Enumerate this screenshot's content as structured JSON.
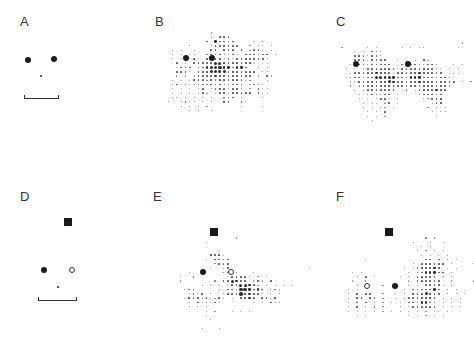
{
  "figure": {
    "panels": [
      {
        "id": "A",
        "label": "A",
        "label_pos": [
          20,
          14
        ],
        "marks": [
          {
            "type": "filled",
            "x": 28,
            "y": 60,
            "r": 3.2
          },
          {
            "type": "filled",
            "x": 54,
            "y": 59,
            "r": 3.2
          },
          {
            "type": "nose",
            "x": 41,
            "y": 76,
            "r": 1.2
          }
        ],
        "bracket": {
          "x1": 24,
          "x2": 59,
          "y": 95
        }
      },
      {
        "id": "B",
        "label": "B",
        "label_pos": [
          155,
          14
        ],
        "marks": [
          {
            "type": "filled",
            "x": 186,
            "y": 58,
            "r": 3.2
          },
          {
            "type": "filled",
            "x": 212,
            "y": 58,
            "r": 3.2
          }
        ],
        "grid": {
          "x0": 164,
          "y0": 33,
          "dx": 4.3,
          "dy": 4.3,
          "rows": [
            "...........1.................",
            "...........1.222.............",
            "..........2.32222....1.1.....",
            "......1....1222222..1.11.1...",
            "..1.1..1...22.222.2.1221.1...",
            "..1.1.11..12221221.222222.1..",
            "..1.1.121.222212122222221....",
            "...2.1.222224432232221.11....",
            "...1222.223545332332..1.1....",
            "...2221.22344442322222.11....",
            "...1.1.12222332222222.1.21...",
            "..1.1.122212222222211...1....",
            "..12121122122211222.1221.....",
            "..1.1.1.12.12221221.1.211....",
            "..1.1.1.121.122122222.211....",
            "..11.1.1.1.1..222.1....1.....",
            ".1..1211.1.1..22..21.........",
            "....1.1.1.1.......1....1.....",
            "......1.1..1.................."
          ]
        }
      },
      {
        "id": "C",
        "label": "C",
        "label_pos": [
          336,
          14
        ],
        "marks": [
          {
            "type": "filled",
            "x": 356,
            "y": 64,
            "r": 3.2
          },
          {
            "type": "filled",
            "x": 408,
            "y": 64,
            "r": 3.2
          }
        ],
        "grid": {
          "x0": 342,
          "y0": 43,
          "dx": 4.3,
          "dy": 4.3,
          "rows": [
            "............................1.",
            "1.....1.1.....1.1.11.......1..",
            "...1.1.221...................",
            "...2221221...................",
            "...22212222..1.1.1.21..........",
            "..1.22122222..212221221...1.1.",
            ".1.1.1222222212222222211.1.1..",
            "..1222223332122223332222.111...",
            ".1222222443432223332222221.....",
            "..1122222334322222333222222.1.1",
            "..1.1222222322222222222221.....",
            "...1.12222222.12.12222322......",
            "....1.122122.1....122222.......",
            "....1.1.1221.1.....11223.......",
            ".....1.11.12.1.......122.......",
            ".....1.1.11.1.......1.1.1......",
            "......1.1.2..........1.11......",
            "......1.1.1...........1........",
            ".......1......................."
          ]
        }
      },
      {
        "id": "D",
        "label": "D",
        "label_pos": [
          20,
          189
        ],
        "marks": [
          {
            "type": "square",
            "x": 68,
            "y": 222,
            "r": 4
          },
          {
            "type": "filled",
            "x": 44,
            "y": 270,
            "r": 3
          },
          {
            "type": "open",
            "x": 72,
            "y": 270,
            "r": 3
          },
          {
            "type": "nose",
            "x": 58,
            "y": 287,
            "r": 1.2
          }
        ],
        "bracket": {
          "x1": 38,
          "x2": 77,
          "y": 297
        }
      },
      {
        "id": "E",
        "label": "E",
        "label_pos": [
          153,
          189
        ],
        "marks": [
          {
            "type": "square",
            "x": 214,
            "y": 232,
            "r": 4
          },
          {
            "type": "filled",
            "x": 203,
            "y": 272,
            "r": 3.2
          },
          {
            "type": "open",
            "x": 231,
            "y": 272,
            "r": 3.2
          }
        ],
        "grid": {
          "x0": 172,
          "y0": 238,
          "dx": 4.3,
          "dy": 4.3,
          "rows": [
            "...............1..............",
            "........1......................",
            "...............................",
            "...........1..................",
            ".........2221..................",
            "........1.2222.................",
            "..........1222.................",
            ".........1..12..................1",
            "....1.......22.1...1............",
            "..1..2.......122221.1.1........",
            "..1.......1.224322.121.2.........",
            ".......1.1.1.12244321.1.1.1.1....",
            "...122.....1.222553232.121.......",
            "....1212.1..1222533221.1.1.......",
            "...1222121121.1.2232.2212.........",
            "....1.212121.......1.1.211........",
            "....1.1.1.........................",
            "........1.1...1.1.1..............",
            "........1.........................",
            ".........1........................",
            "..................................",
            ".......1...1......................"
          ]
        }
      },
      {
        "id": "F",
        "label": "F",
        "label_pos": [
          336,
          189
        ],
        "marks": [
          {
            "type": "square",
            "x": 389,
            "y": 232,
            "r": 4
          },
          {
            "type": "open",
            "x": 367,
            "y": 286,
            "r": 3.2
          },
          {
            "type": "filled",
            "x": 395,
            "y": 286,
            "r": 3.2
          }
        ],
        "grid": {
          "x0": 340,
          "y0": 238,
          "dx": 4.3,
          "dy": 4.3,
          "rows": [
            "....................1.1.........",
            ".................1...1..1.......",
            "...................1.1..........",
            "..................1.1.1.1.......",
            "...................1.1.1.1......",
            "......1.............22.2.1.1....",
            ".................1.222222.1....1",
            "...............1.1233332.1.1....",
            "...1.1..........1.2233322.1.....",
            "....1.2.1.....1.1.22222.1.1.....",
            "...1..1.........1.222222..1....1",
            "....1.....1.....1.1.22221.1.....",
            "..1.1..........1.2222232.2.1....",
            "..1.2.22..1..1.1.2224322.1.1.1..",
            "..1.22.22.1..1.12223332.1.1.1...",
            "..1.2.2.2.1.1.1.2223322.1.1.1...",
            "..1.2.1.2.1...1.1222222.1.1.1...",
            "..1.1.1.1.1.1.1.1.1.1.11.1......",
            "....1.1.........1.1.1.1.1......"
          ]
        }
      }
    ]
  }
}
